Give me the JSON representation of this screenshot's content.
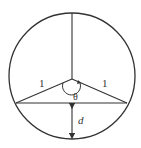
{
  "diagram": {
    "type": "geometry",
    "labels": {
      "left_radius": "1",
      "right_radius": "1",
      "angle": "θ",
      "distance": "d"
    },
    "colors": {
      "stroke": "#333333",
      "background": "#ffffff"
    }
  }
}
